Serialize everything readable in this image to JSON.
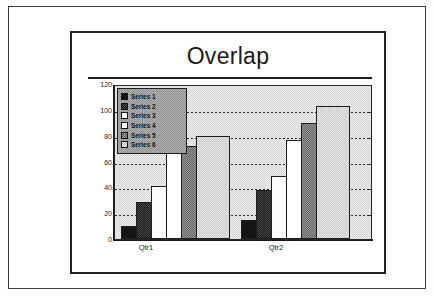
{
  "slide": {
    "title": "Overlap"
  },
  "chart_data": {
    "type": "bar",
    "title": "Overlap",
    "xlabel": "",
    "ylabel": "",
    "categories": [
      "Qtr1",
      "Qtr2"
    ],
    "yticks": [
      120,
      100,
      80,
      60,
      40,
      20,
      0
    ],
    "ylim": [
      0,
      120
    ],
    "grid": true,
    "grid_style": "dotted-horizontal",
    "legend_position": "upper-left-inside",
    "overlap": "bars within each category overlap and step upward left-to-right",
    "series": [
      {
        "name": "Series 1",
        "values": [
          10,
          15
        ],
        "fill": "solid-black",
        "color": "#151515"
      },
      {
        "name": "Series 2",
        "values": [
          29,
          38
        ],
        "fill": "dark-gray-dither",
        "color": "#333333"
      },
      {
        "name": "Series 3",
        "values": [
          41,
          49
        ],
        "fill": "white",
        "color": "#fbfbfb"
      },
      {
        "name": "Series 4",
        "values": [
          69,
          77
        ],
        "fill": "white",
        "color": "#ffffff"
      },
      {
        "name": "Series 5",
        "values": [
          72,
          90
        ],
        "fill": "medium-gray-dither",
        "color": "#7d7d7d"
      },
      {
        "name": "Series 6",
        "values": [
          80,
          103
        ],
        "fill": "light-gray-dither",
        "color": "#d6d6d6"
      }
    ]
  }
}
